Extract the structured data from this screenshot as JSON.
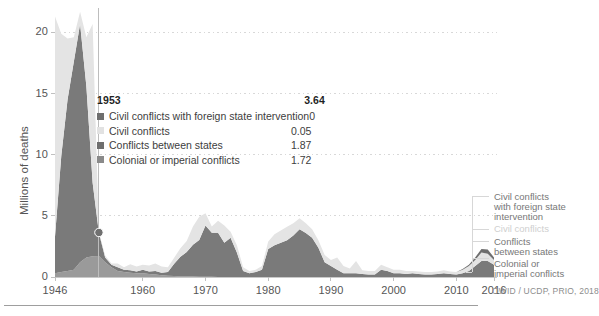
{
  "axes": {
    "y_title": "Millions of deaths",
    "y_ticks": [
      "0",
      "5",
      "10",
      "15",
      "20"
    ],
    "x_ticks": [
      "1946",
      "1960",
      "1970",
      "1980",
      "1990",
      "2000",
      "2010",
      "2016"
    ]
  },
  "tooltip": {
    "year": "1953",
    "total": "3.64",
    "rows": [
      {
        "label": "Civil conflicts with foreign state intervention",
        "value": "0",
        "color": "#6e6e6e"
      },
      {
        "label": "Civil conflicts",
        "value": "0.05",
        "color": "#e2e2e2"
      },
      {
        "label": "Conflicts between states",
        "value": "1.87",
        "color": "#6e6e6e"
      },
      {
        "label": "Colonial or imperial conflicts",
        "value": "1.72",
        "color": "#8a8a8a"
      }
    ]
  },
  "side_labels": [
    {
      "text": "Civil conflicts",
      "faded": false
    },
    {
      "text": "with foreign state",
      "faded": false
    },
    {
      "text": "intervention",
      "faded": false
    },
    {
      "text": "Civil conflicts",
      "faded": true
    },
    {
      "text": "Conflicts",
      "faded": false
    },
    {
      "text": "between states",
      "faded": false
    },
    {
      "text": "Colonial or",
      "faded": false
    },
    {
      "text": "imperial conflicts",
      "faded": false
    }
  ],
  "source_note": "OWID / UCDP, PRIO, 2018",
  "colors": {
    "civil_intervention": "#6e6e6e",
    "civil": "#e4e4e4",
    "interstate": "#7a7a7a",
    "colonial": "#9a9a9a",
    "gridline": "#d8d8d8",
    "axis_text": "#555555",
    "selection_line": "#bdbdbd",
    "marker": "#707070"
  },
  "chart_data": {
    "type": "area",
    "title": "",
    "subtitle": "",
    "xlabel": "",
    "ylabel": "Millions of deaths",
    "xlim": [
      1946,
      2016
    ],
    "ylim": [
      0,
      22
    ],
    "grid": true,
    "stacked": true,
    "legend_position": "right",
    "annotations": [
      {
        "type": "selection-line",
        "x": 1953,
        "label": "1953"
      },
      {
        "type": "marker",
        "x": 1953,
        "y": 3.64
      }
    ],
    "x": [
      1946,
      1947,
      1948,
      1949,
      1950,
      1951,
      1952,
      1953,
      1954,
      1955,
      1956,
      1957,
      1958,
      1959,
      1960,
      1961,
      1962,
      1963,
      1964,
      1965,
      1966,
      1967,
      1968,
      1969,
      1970,
      1971,
      1972,
      1973,
      1974,
      1975,
      1976,
      1977,
      1978,
      1979,
      1980,
      1981,
      1982,
      1983,
      1984,
      1985,
      1986,
      1987,
      1988,
      1989,
      1990,
      1991,
      1992,
      1993,
      1994,
      1995,
      1996,
      1997,
      1998,
      1999,
      2000,
      2001,
      2002,
      2003,
      2004,
      2005,
      2006,
      2007,
      2008,
      2009,
      2010,
      2011,
      2012,
      2013,
      2014,
      2015,
      2016
    ],
    "series": [
      {
        "name": "Colonial or imperial conflicts",
        "color": "#9a9a9a",
        "values": [
          0.3,
          0.4,
          0.5,
          0.6,
          1.2,
          1.6,
          1.7,
          1.72,
          1.2,
          0.8,
          0.5,
          0.4,
          0.35,
          0.3,
          0.3,
          0.25,
          0.2,
          0.15,
          0.1,
          0.08,
          0.05,
          0.05,
          0.04,
          0.03,
          0.02,
          0.02,
          0.01,
          0.01,
          0.01,
          0,
          0,
          0,
          0,
          0,
          0,
          0,
          0,
          0,
          0,
          0,
          0,
          0,
          0,
          0,
          0,
          0,
          0,
          0,
          0,
          0,
          0,
          0,
          0,
          0,
          0,
          0,
          0,
          0,
          0,
          0,
          0,
          0,
          0,
          0,
          0,
          0,
          0,
          0,
          0,
          0,
          0
        ]
      },
      {
        "name": "Conflicts between states",
        "color": "#7a7a7a",
        "values": [
          3.0,
          9.5,
          14.0,
          17.0,
          19.5,
          14.0,
          6.0,
          1.87,
          0.4,
          0.2,
          0.3,
          0.2,
          0.2,
          0.15,
          0.3,
          0.2,
          0.3,
          0.2,
          0.3,
          1.0,
          1.6,
          2.0,
          2.6,
          3.0,
          4.2,
          3.6,
          3.6,
          2.8,
          3.2,
          2.0,
          0.5,
          0.3,
          0.4,
          0.6,
          2.3,
          2.6,
          2.8,
          3.0,
          3.4,
          3.9,
          3.6,
          3.2,
          2.4,
          1.2,
          0.9,
          0.6,
          0.3,
          0.3,
          0.3,
          0.25,
          0.2,
          0.2,
          0.6,
          0.5,
          0.3,
          0.3,
          0.25,
          0.3,
          0.25,
          0.2,
          0.2,
          0.25,
          0.3,
          0.25,
          0.2,
          0.3,
          0.5,
          0.9,
          1.3,
          1.3,
          1.0
        ]
      },
      {
        "name": "Civil conflicts",
        "color": "#e4e4e4",
        "values": [
          18.0,
          10.0,
          5.0,
          2.0,
          1.0,
          4.0,
          13.0,
          0.05,
          0.15,
          0.1,
          0.3,
          0.2,
          0.5,
          0.4,
          0.4,
          0.5,
          0.6,
          0.5,
          0.4,
          0.5,
          0.7,
          0.9,
          1.5,
          1.9,
          1.0,
          0.5,
          1.0,
          1.4,
          0.5,
          0.6,
          0.3,
          0.2,
          0.2,
          0.3,
          0.6,
          0.9,
          1.0,
          1.1,
          1.0,
          0.9,
          0.8,
          0.7,
          0.6,
          0.6,
          0.5,
          1.0,
          0.6,
          0.4,
          1.0,
          0.3,
          0.3,
          0.3,
          0.4,
          0.3,
          0.3,
          0.3,
          0.25,
          0.2,
          0.2,
          0.2,
          0.2,
          0.2,
          0.25,
          0.2,
          0.2,
          0.3,
          0.4,
          0.5,
          0.7,
          0.6,
          0.4
        ]
      },
      {
        "name": "Civil conflicts with foreign state intervention",
        "color": "#6e6e6e",
        "values": [
          0,
          0,
          0,
          0,
          0,
          0,
          0,
          0,
          0,
          0,
          0,
          0,
          0,
          0,
          0,
          0,
          0,
          0,
          0,
          0,
          0,
          0,
          0,
          0,
          0,
          0,
          0,
          0,
          0,
          0,
          0,
          0,
          0,
          0,
          0,
          0,
          0,
          0,
          0,
          0,
          0,
          0,
          0,
          0,
          0,
          0,
          0,
          0,
          0,
          0,
          0,
          0,
          0,
          0,
          0,
          0,
          0,
          0,
          0,
          0,
          0,
          0,
          0,
          0,
          0,
          0.05,
          0.1,
          0.2,
          0.3,
          0.35,
          0.2
        ]
      }
    ],
    "totals_note": "Stacked total peaks at ~21.3 million deaths in 1950"
  }
}
